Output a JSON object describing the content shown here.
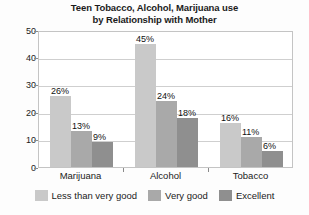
{
  "chart_data": {
    "type": "bar",
    "title": "Teen Tobacco, Alcohol, Marijuana use by Relationship with Mother",
    "title_line_1": "Teen Tobacco, Alcohol, Marijuana use",
    "title_line_2": "by Relationship with Mother",
    "xlabel": "",
    "ylabel": "",
    "ylim": [
      0,
      50
    ],
    "ytick_labels": [
      "0",
      "10",
      "20",
      "30",
      "40",
      "50"
    ],
    "ytick_values": [
      0,
      10,
      20,
      30,
      40,
      50
    ],
    "grid": true,
    "grid_axis": "y",
    "legend_position": "bottom",
    "categories": [
      "Marijuana",
      "Alcohol",
      "Tobacco"
    ],
    "series": [
      {
        "name": "Less than very good",
        "color": "#c9c9c9",
        "values": [
          26,
          45,
          16
        ],
        "labels": [
          "26%",
          "45%",
          "16%"
        ]
      },
      {
        "name": "Very good",
        "color": "#a9a9a9",
        "values": [
          13,
          24,
          11
        ],
        "labels": [
          "13%",
          "24%",
          "11%"
        ]
      },
      {
        "name": "Excellent",
        "color": "#8f8f8f",
        "values": [
          9,
          18,
          6
        ],
        "labels": [
          "9%",
          "18%",
          "6%"
        ]
      }
    ]
  },
  "legend": {
    "items": [
      {
        "label": "Less than very good",
        "color": "#c9c9c9"
      },
      {
        "label": "Very good",
        "color": "#a9a9a9"
      },
      {
        "label": "Excellent",
        "color": "#8f8f8f"
      }
    ]
  },
  "axis": {
    "y_labels": [
      "50",
      "40",
      "30",
      "20",
      "10",
      "0"
    ],
    "x_labels": [
      "Marijuana",
      "Alcohol",
      "Tobacco"
    ]
  }
}
